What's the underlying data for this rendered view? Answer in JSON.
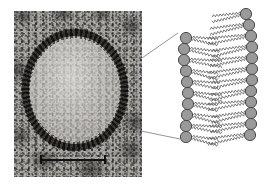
{
  "figure": {
    "panels": [
      "micrograph-panel",
      "bilayer-panel"
    ]
  },
  "micrograph": {
    "label": "electron micrograph of a liposome vesicle",
    "subject": "liposome",
    "membrane_appearance": "dark granular ring",
    "lumen_appearance": "light granular interior",
    "scale_bar": {
      "label": "",
      "orientation": "horizontal",
      "has_end_caps": true,
      "length_px": 66
    },
    "colors": {
      "background": "#b0aeab",
      "membrane": "#181614",
      "lumen": "#ebe9e6"
    }
  },
  "bilayer": {
    "label": "phospholipid bilayer",
    "leaflets": [
      {
        "name": "outer-leaflet",
        "head_count": 10
      },
      {
        "name": "inner-leaflet",
        "head_count": 11
      }
    ],
    "head_group": {
      "name": "phospholipid-head",
      "shape": "circle",
      "fill": "#9a9a9a",
      "stroke": "#4a4a4a",
      "radius_px": 5.6
    },
    "tail": {
      "name": "hydrocarbon-tail",
      "shape": "wavy-line",
      "stroke": "#555555",
      "tails_per_head": 2
    },
    "outer_heads": [
      {
        "cx": 26,
        "cy": 38
      },
      {
        "cx": 24,
        "cy": 49
      },
      {
        "cx": 24,
        "cy": 60
      },
      {
        "cx": 26,
        "cy": 71
      },
      {
        "cx": 27,
        "cy": 82
      },
      {
        "cx": 28,
        "cy": 93
      },
      {
        "cx": 28,
        "cy": 104
      },
      {
        "cx": 27,
        "cy": 115
      },
      {
        "cx": 26,
        "cy": 126
      },
      {
        "cx": 26,
        "cy": 137
      }
    ],
    "inner_heads": [
      {
        "cx": 86,
        "cy": 14
      },
      {
        "cx": 89,
        "cy": 25
      },
      {
        "cx": 91,
        "cy": 36
      },
      {
        "cx": 92,
        "cy": 47
      },
      {
        "cx": 92,
        "cy": 58
      },
      {
        "cx": 92,
        "cy": 69
      },
      {
        "cx": 92,
        "cy": 80
      },
      {
        "cx": 91,
        "cy": 91
      },
      {
        "cx": 91,
        "cy": 102
      },
      {
        "cx": 91,
        "cy": 113
      },
      {
        "cx": 91,
        "cy": 124
      },
      {
        "cx": 90,
        "cy": 135
      }
    ]
  },
  "leader_lines": [
    {
      "name": "upper-leader-line",
      "from": [
        142,
        58
      ],
      "to": [
        178,
        33
      ]
    },
    {
      "name": "lower-leader-line",
      "from": [
        141,
        131
      ],
      "to": [
        180,
        139
      ]
    }
  ],
  "colors": {
    "page_background": "#ffffff",
    "head_fill": "#9a9a9a",
    "head_stroke": "#4a4a4a",
    "tail_stroke": "#555555",
    "leader_stroke": "#888888"
  }
}
